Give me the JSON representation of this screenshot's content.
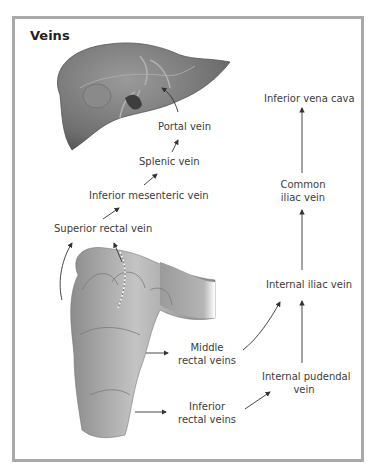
{
  "diagram": {
    "title": "Veins",
    "labels": {
      "portal_vein": "Portal vein",
      "splenic_vein": "Splenic vein",
      "inferior_mesenteric_vein": "Inferior mesenteric vein",
      "superior_rectal_vein": "Superior rectal vein",
      "inferior_vena_cava": "Inferior vena cava",
      "common_iliac_vein_1": "Common",
      "common_iliac_vein_2": "iliac vein",
      "internal_iliac_vein": "Internal iliac vein",
      "middle_rectal_veins_1": "Middle",
      "middle_rectal_veins_2": "rectal veins",
      "internal_pudendal_vein_1": "Internal pudendal",
      "internal_pudendal_vein_2": "vein",
      "inferior_rectal_veins_1": "Inferior",
      "inferior_rectal_veins_2": "rectal veins"
    },
    "illustrations": [
      "liver",
      "rectum"
    ],
    "colors": {
      "frame": "#a9a9a9",
      "arrow": "#333333",
      "organ": "#8a8a8a"
    }
  }
}
